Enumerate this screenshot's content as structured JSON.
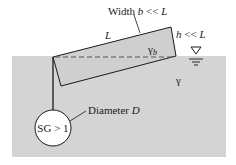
{
  "diagram": {
    "labels": {
      "width": "Width ",
      "width_var": "b",
      "width_rel": " << ",
      "width_L": "L",
      "length": "L",
      "thickness_var": "h",
      "thickness_rel": " << ",
      "thickness_L": "L",
      "rod_specific_weight": "γ",
      "rod_specific_weight_sub": "b",
      "fluid_specific_weight": "γ",
      "diameter": "Diameter ",
      "diameter_var": "D",
      "sphere_label": "SG > 1"
    },
    "colors": {
      "water": "#d4d4d4",
      "rod_fill": "#cfcfcf",
      "outline": "#1a1a1a",
      "sphere_fill": "#ffffff",
      "background": "#ffffff"
    },
    "icons": {
      "free_surface": "free-surface-symbol"
    }
  }
}
